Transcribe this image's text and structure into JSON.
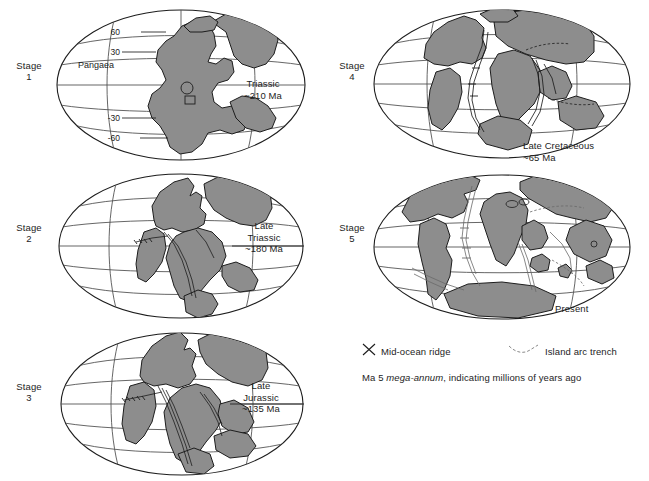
{
  "figure": {
    "continent_color": "#8d8d8d",
    "ocean_color": "#ffffff",
    "outline_color": "#1d1d1d",
    "graticule_color": "#4a4a4a"
  },
  "panels": [
    {
      "id": "stage-1",
      "stage_label": "Stage\n1",
      "era_label": "Triassic\n~210 Ma",
      "supercontinent_label": "Pangaea",
      "latitudes": [
        "60",
        "30",
        "-30",
        "-60"
      ]
    },
    {
      "id": "stage-2",
      "stage_label": "Stage\n2",
      "era_label": "Late\nTriassic\n~180 Ma",
      "supercontinent_label": "",
      "latitudes": []
    },
    {
      "id": "stage-3",
      "stage_label": "Stage\n3",
      "era_label": "Late\nJurassic\n~135 Ma",
      "supercontinent_label": "",
      "latitudes": []
    },
    {
      "id": "stage-4",
      "stage_label": "Stage\n4",
      "era_label": "Late Cretaceous\n~65 Ma",
      "supercontinent_label": "",
      "latitudes": []
    },
    {
      "id": "stage-5",
      "stage_label": "Stage\n5",
      "era_label": "Present",
      "supercontinent_label": "",
      "latitudes": []
    }
  ],
  "legend": {
    "ridge_label": "Mid-ocean ridge",
    "ridge_icon": "mid-ocean-ridge-icon",
    "trench_label": "Island arc trench",
    "trench_icon": "island-arc-trench-icon",
    "note_prefix": "Ma 5 ",
    "note_italic": "mega-annum",
    "note_suffix": ", indicating millions of years ago"
  }
}
